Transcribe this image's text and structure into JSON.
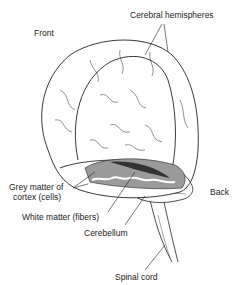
{
  "labels": {
    "front": "Front",
    "cerebral_hemispheres": "Cerebral hemispheres",
    "back": "Back",
    "grey_matter_line1": "Grey matter of",
    "grey_matter_line2": "cortex (cells)",
    "white_matter": "White matter (fibers)",
    "cerebellum": "Cerebellum",
    "spinal_cord": "Spinal cord"
  },
  "colors": {
    "line": "#222222",
    "grey_matter": "#9a9a9a",
    "dark_cut": "#333333"
  }
}
